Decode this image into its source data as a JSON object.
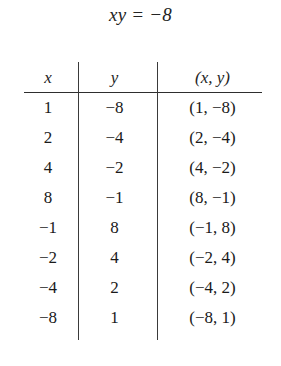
{
  "title": {
    "equation": "xy = −8"
  },
  "table": {
    "columns": [
      {
        "key": "x",
        "label": "x"
      },
      {
        "key": "y",
        "label": "y"
      },
      {
        "key": "pair",
        "label": "(x, y)"
      }
    ],
    "rows": [
      {
        "x": "1",
        "y": "−8",
        "pair": "(1, −8)"
      },
      {
        "x": "2",
        "y": "−4",
        "pair": "(2, −4)"
      },
      {
        "x": "4",
        "y": "−2",
        "pair": "(4, −2)"
      },
      {
        "x": "8",
        "y": "−1",
        "pair": "(8, −1)"
      },
      {
        "x": "−1",
        "y": "8",
        "pair": "(−1, 8)"
      },
      {
        "x": "−2",
        "y": "4",
        "pair": "(−2, 4)"
      },
      {
        "x": "−4",
        "y": "2",
        "pair": "(−4, 2)"
      },
      {
        "x": "−8",
        "y": "1",
        "pair": "(−8, 1)"
      }
    ]
  },
  "style": {
    "ink": "#1a1a1a",
    "rule": "#2e2e2e",
    "background": "#ffffff"
  }
}
